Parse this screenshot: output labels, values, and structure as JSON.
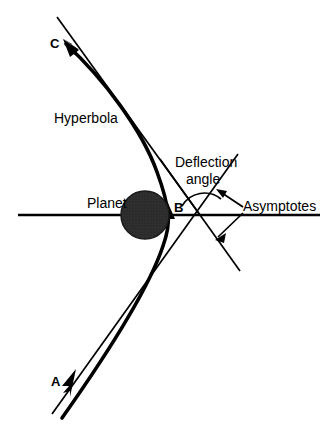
{
  "figure": {
    "type": "diagram",
    "background_color": "#ffffff",
    "stroke_color": "#000000",
    "width": 326,
    "height": 432
  },
  "labels": {
    "point_a": "A",
    "point_b": "B",
    "point_c": "C",
    "planet": "Planet",
    "hyperbola": "Hyperbola",
    "deflection_line1": "Deflection",
    "deflection_line2": "angle",
    "asymptotes": "Asymptotes"
  },
  "geometry": {
    "planet": {
      "center_x": 145,
      "center_y": 215,
      "radius": 24,
      "fill": "#2b2b2b"
    },
    "axis": {
      "x1": 18,
      "y1": 215,
      "x2": 320,
      "y2": 215
    },
    "vertex_b": {
      "x": 168,
      "y": 214
    },
    "asymptote_crossing": {
      "x": 200,
      "y": 215
    },
    "arrow_a": {
      "x": 71,
      "y": 377
    },
    "arrow_c": {
      "x": 66,
      "y": 43
    },
    "deflection_arc_radius": 28
  }
}
